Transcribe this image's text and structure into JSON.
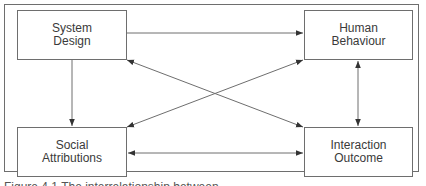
{
  "diagram": {
    "nodes": [
      {
        "id": "system_design",
        "line1": "System",
        "line2": "Design"
      },
      {
        "id": "human_behaviour",
        "line1": "Human",
        "line2": "Behaviour"
      },
      {
        "id": "social_attributions",
        "line1": "Social",
        "line2": "Attributions"
      },
      {
        "id": "interaction_outcome",
        "line1": "Interaction",
        "line2": "Outcome"
      }
    ],
    "edges": [
      {
        "from": "System Design",
        "to": "Human Behaviour",
        "direction": "one-way"
      },
      {
        "from": "System Design",
        "to": "Social Attributions",
        "direction": "one-way"
      },
      {
        "from": "Human Behaviour",
        "to": "Interaction Outcome",
        "direction": "two-way"
      },
      {
        "from": "Social Attributions",
        "to": "Interaction Outcome",
        "direction": "two-way"
      },
      {
        "from": "System Design",
        "to": "Interaction Outcome",
        "direction": "two-way"
      },
      {
        "from": "Social Attributions",
        "to": "Human Behaviour",
        "direction": "two-way"
      }
    ],
    "line_color": "#6e6e6e"
  },
  "caption": "Figure 4.1 The interrelationship between"
}
